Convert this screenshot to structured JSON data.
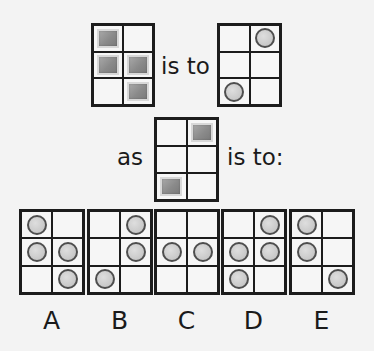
{
  "puzzle": {
    "type": "visual-analogy",
    "connector_1": "is to",
    "connector_2": "as",
    "connector_3": "is to:",
    "legend": {
      "S": "shaded-square",
      "C": "circle",
      "_": "empty"
    },
    "source": {
      "cells": [
        "S",
        "_",
        "S",
        "S",
        "_",
        "S"
      ]
    },
    "source_result": {
      "cells": [
        "_",
        "C",
        "_",
        "_",
        "C",
        "_"
      ]
    },
    "target": {
      "cells": [
        "_",
        "S",
        "_",
        "_",
        "S",
        "_"
      ]
    },
    "options": [
      {
        "label": "A",
        "cells": [
          "C",
          "_",
          "C",
          "C",
          "_",
          "C"
        ]
      },
      {
        "label": "B",
        "cells": [
          "_",
          "C",
          "_",
          "C",
          "C",
          "_"
        ]
      },
      {
        "label": "C",
        "cells": [
          "_",
          "_",
          "C",
          "C",
          "_",
          "_"
        ]
      },
      {
        "label": "D",
        "cells": [
          "_",
          "C",
          "C",
          "C",
          "C",
          "_"
        ]
      },
      {
        "label": "E",
        "cells": [
          "C",
          "_",
          "C",
          "_",
          "_",
          "C"
        ]
      }
    ]
  },
  "colors": {
    "background": "#f3f3f3",
    "grid_line": "#1c1c1c",
    "cell_fill": "#f6f6f6",
    "square_fill": "#8a8a8a",
    "circle_fill": "#c8c8c8",
    "circle_outline": "#4e4e4e"
  }
}
